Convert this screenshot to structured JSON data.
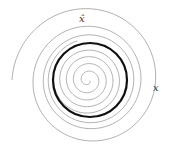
{
  "diagram": {
    "type": "phase-portrait-limit-cycle",
    "center": [
      90,
      80
    ],
    "limit_cycle": {
      "radius": 37,
      "stroke": "#111111",
      "stroke_width": 2.2
    },
    "outer_trajectory": {
      "stroke": "#9a9a9a",
      "stroke_width": 0.8,
      "start_angle_deg": 180,
      "start_radius": 78,
      "turns": 3.2,
      "decay": 0.45,
      "direction": "clockwise-inward"
    },
    "inner_trajectory": {
      "stroke": "#9a9a9a",
      "stroke_width": 0.8,
      "start_radius": 2,
      "turns": 4.6,
      "growth": 0.5,
      "direction": "outward"
    },
    "labels": {
      "xhat": "x̂",
      "x": "x"
    }
  }
}
